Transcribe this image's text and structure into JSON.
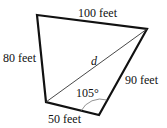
{
  "diagram": {
    "type": "quadrilateral",
    "sides": {
      "top": "100 feet",
      "left": "80 feet",
      "right": "90 feet",
      "bottom": "50 feet"
    },
    "diagonal_label": "d",
    "angle_label": "105°",
    "colors": {
      "stroke": "#111111",
      "background": "#ffffff"
    }
  }
}
